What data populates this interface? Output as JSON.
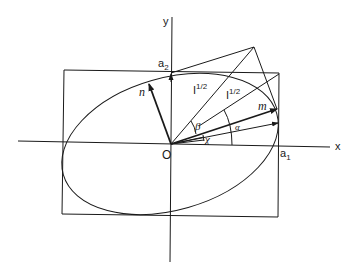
{
  "figure": {
    "labels": {
      "x_axis": "x",
      "y_axis": "y",
      "origin": "O",
      "a1": "a",
      "a1_sub": "1",
      "a2": "a",
      "a2_sub": "2",
      "n": "n",
      "m": "m",
      "I_half_1": "I",
      "I_half_1_sup": "1/2",
      "I_half_2": "I",
      "I_half_2_sup": "1/2",
      "beta": "β",
      "alpha": "α",
      "chi": "χ"
    },
    "colors": {
      "ink": "#1a1a1a",
      "background": "#ffffff"
    }
  }
}
